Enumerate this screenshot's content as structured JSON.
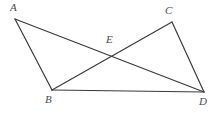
{
  "figure": {
    "kind": "geometry-diagram",
    "width": 213,
    "height": 113,
    "background_color": "#ffffff",
    "stroke_color": "#3a3a3a",
    "stroke_width": 1.2,
    "label_color": "#4a4a4a"
  },
  "points": [
    {
      "id": "A",
      "label": "A",
      "x": 15,
      "y": 19,
      "label_x": 10,
      "label_y": 2
    },
    {
      "id": "B",
      "label": "B",
      "x": 52,
      "y": 90,
      "label_x": 45,
      "label_y": 94
    },
    {
      "id": "C",
      "label": "C",
      "x": 172,
      "y": 22,
      "label_x": 165,
      "label_y": 5
    },
    {
      "id": "D",
      "label": "D",
      "x": 204,
      "y": 92,
      "label_x": 199,
      "label_y": 96
    },
    {
      "id": "E",
      "label": "E",
      "x": 111,
      "y": 57,
      "label_x": 106,
      "label_y": 34
    }
  ],
  "segments": [
    {
      "id": "AB",
      "from": "A",
      "to": "B",
      "x1": 15,
      "y1": 19,
      "x2": 52,
      "y2": 90
    },
    {
      "id": "AD",
      "from": "A",
      "to": "D",
      "x1": 15,
      "y1": 19,
      "x2": 204,
      "y2": 92
    },
    {
      "id": "BC",
      "from": "B",
      "to": "C",
      "x1": 52,
      "y1": 90,
      "x2": 172,
      "y2": 22
    },
    {
      "id": "BD",
      "from": "B",
      "to": "D",
      "x1": 52,
      "y1": 90,
      "x2": 204,
      "y2": 92
    },
    {
      "id": "CD",
      "from": "C",
      "to": "D",
      "x1": 172,
      "y1": 22,
      "x2": 204,
      "y2": 92
    }
  ]
}
